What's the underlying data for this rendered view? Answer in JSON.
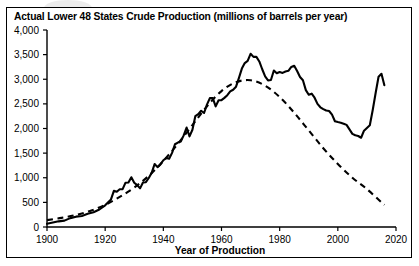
{
  "chart_data": {
    "type": "line",
    "title": "Actual Lower 48 States Crude Production (millions of barrels per year)",
    "xlabel": "Year of Production",
    "ylabel": "",
    "xlim": [
      1900,
      2020
    ],
    "ylim": [
      0,
      4000
    ],
    "xticks": [
      1900,
      1920,
      1940,
      1960,
      1980,
      2000,
      2020
    ],
    "xtick_labels": [
      "1900",
      "1920",
      "1940",
      "1960",
      "1980",
      "2000",
      "2020"
    ],
    "yticks": [
      0,
      500,
      1000,
      1500,
      2000,
      2500,
      3000,
      3500,
      4000
    ],
    "ytick_labels": [
      "0",
      "500",
      "1,000",
      "1,500",
      "2,000",
      "2,500",
      "3,000",
      "3,500",
      "4,000"
    ],
    "grid": false,
    "legend": "none",
    "line_color": "#000000",
    "background_color": "#ffffff",
    "series": [
      {
        "name": "Actual production",
        "style": "solid",
        "x": [
          1900,
          1902,
          1904,
          1906,
          1908,
          1910,
          1912,
          1914,
          1916,
          1918,
          1920,
          1922,
          1923,
          1924,
          1925,
          1926,
          1927,
          1928,
          1929,
          1930,
          1931,
          1932,
          1933,
          1934,
          1935,
          1936,
          1937,
          1938,
          1939,
          1940,
          1941,
          1942,
          1943,
          1944,
          1945,
          1946,
          1947,
          1948,
          1949,
          1950,
          1951,
          1952,
          1953,
          1954,
          1955,
          1956,
          1957,
          1958,
          1959,
          1960,
          1961,
          1962,
          1963,
          1964,
          1965,
          1966,
          1967,
          1968,
          1969,
          1970,
          1971,
          1972,
          1973,
          1974,
          1975,
          1976,
          1977,
          1978,
          1979,
          1980,
          1981,
          1982,
          1983,
          1984,
          1985,
          1986,
          1987,
          1988,
          1989,
          1990,
          1991,
          1992,
          1993,
          1994,
          1995,
          1996,
          1997,
          1998,
          1999,
          2000,
          2001,
          2002,
          2003,
          2004,
          2005,
          2006,
          2007,
          2008,
          2009,
          2010,
          2011,
          2012,
          2013,
          2014,
          2015,
          2016
        ],
        "y": [
          65,
          90,
          115,
          130,
          180,
          210,
          225,
          270,
          300,
          355,
          440,
          560,
          735,
          715,
          765,
          770,
          900,
          905,
          1010,
          900,
          850,
          785,
          905,
          910,
          995,
          1100,
          1280,
          1215,
          1270,
          1355,
          1400,
          1385,
          1505,
          1680,
          1715,
          1735,
          1860,
          2020,
          1840,
          1974,
          2250,
          2290,
          2360,
          2315,
          2484,
          2617,
          2617,
          2449,
          2575,
          2575,
          2622,
          2676,
          2753,
          2787,
          2849,
          3028,
          3216,
          3329,
          3372,
          3517,
          3454,
          3455,
          3361,
          3203,
          3057,
          2976,
          2985,
          3178,
          3121,
          3147,
          3129,
          3157,
          3171,
          3250,
          3274,
          3168,
          3047,
          2979,
          2779,
          2685,
          2707,
          2625,
          2499,
          2431,
          2394,
          2366,
          2355,
          2281,
          2147,
          2131,
          2118,
          2097,
          2073,
          1983,
          1890,
          1862,
          1848,
          1812,
          1956,
          2011,
          2065,
          2375,
          2720,
          3050,
          3110,
          2880
        ],
        "peak_year": 1970,
        "peak_value": 3517,
        "trough_year": 2008,
        "trough_value": 1812
      },
      {
        "name": "Hubbert curve fit",
        "style": "dashed",
        "x": [
          1900,
          1905,
          1910,
          1915,
          1920,
          1925,
          1930,
          1935,
          1940,
          1945,
          1950,
          1955,
          1960,
          1965,
          1970,
          1975,
          1980,
          1985,
          1990,
          1995,
          2000,
          2005,
          2010,
          2015,
          2016
        ],
        "y": [
          140,
          185,
          245,
          330,
          450,
          610,
          800,
          1040,
          1340,
          1690,
          2070,
          2450,
          2760,
          2940,
          2980,
          2870,
          2640,
          2320,
          1960,
          1600,
          1280,
          1000,
          770,
          500,
          450
        ],
        "peak_year": 1970,
        "peak_value": 2980
      }
    ]
  },
  "figure": {
    "title": "Actual Lower 48 States Crude Production (millions of barrels per year)",
    "xaxis_title": "Year of Production"
  }
}
